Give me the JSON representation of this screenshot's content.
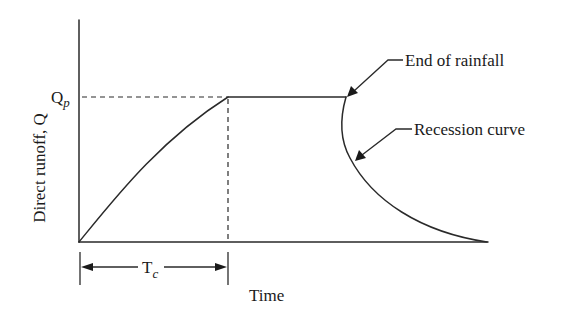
{
  "diagram": {
    "type": "hydrograph",
    "y_axis_label": "Direct runoff, Q",
    "x_axis_label": "Time",
    "peak_label": {
      "main": "Q",
      "subscript": "p"
    },
    "duration_label": {
      "main": "T",
      "subscript": "c"
    },
    "annotations": [
      {
        "id": "end-of-rainfall",
        "text": "End of rainfall"
      },
      {
        "id": "recession-curve",
        "text": "Recession curve"
      }
    ],
    "segments": [
      {
        "name": "rising-limb",
        "description": "Curve rising from origin to peak Qp at time Tc"
      },
      {
        "name": "plateau",
        "description": "Constant peak discharge Qp until end of rainfall"
      },
      {
        "name": "recession-limb",
        "description": "Recession curve falling back to zero after rainfall ends"
      }
    ],
    "colors": {
      "line": "#2a2a2a",
      "background": "#ffffff"
    }
  }
}
